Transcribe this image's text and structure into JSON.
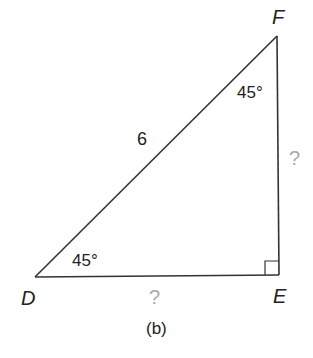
{
  "figure": {
    "caption": "(b)",
    "vertices": {
      "D": {
        "label": "D"
      },
      "E": {
        "label": "E"
      },
      "F": {
        "label": "F"
      }
    },
    "angles": {
      "D": "45°",
      "F": "45°",
      "E": "right-angle"
    },
    "sides": {
      "DF": "6",
      "DE": "?",
      "EF": "?"
    },
    "colors": {
      "line": "#333333",
      "text": "#222222",
      "unknown": "#a8a8a8"
    }
  }
}
